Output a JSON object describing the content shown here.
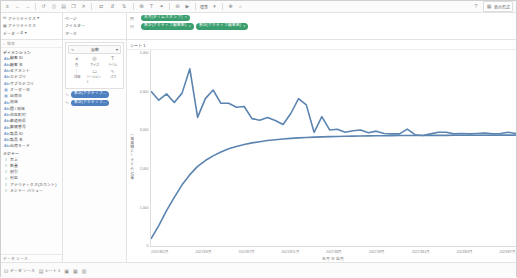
{
  "toolbar": {
    "icons": [
      {
        "name": "tableau-logo-icon",
        "glyph": "≡"
      },
      {
        "name": "back-icon",
        "glyph": "←"
      },
      {
        "name": "forward-icon",
        "glyph": "→"
      },
      {
        "name": "save-icon",
        "glyph": "⎙"
      },
      {
        "name": "undo-icon",
        "glyph": "↺"
      },
      {
        "name": "redo-icon",
        "glyph": "↻"
      },
      {
        "name": "new-worksheet-icon",
        "glyph": "▤"
      },
      {
        "name": "duplicate-icon",
        "glyph": "❐"
      },
      {
        "name": "clear-sheet-icon",
        "glyph": "✕"
      },
      {
        "name": "swap-rows-cols-icon",
        "glyph": "⇄"
      },
      {
        "name": "sort-ascending-icon",
        "glyph": "↓"
      },
      {
        "name": "sort-descending-icon",
        "glyph": "↑"
      },
      {
        "name": "group-icon",
        "glyph": "⊞"
      },
      {
        "name": "labels-icon",
        "glyph": "T"
      },
      {
        "name": "highlight-icon",
        "glyph": "✦"
      },
      {
        "name": "fixed-axis-icon",
        "glyph": "⊟"
      },
      {
        "name": "presentation-icon",
        "glyph": "▶"
      }
    ],
    "fit_label": "標準",
    "fit_caret": "▾",
    "show_me_label": "表示形式",
    "show_me_icon": "show-me-icon",
    "help_icon": "help-icon"
  },
  "datasource": {
    "connection_label": "データ",
    "name": "アナリティクス",
    "caret": "▾",
    "filter_label": "フィルター",
    "page_label": "ページ",
    "columns_label": "列",
    "rows_label": "行"
  },
  "shelves": {
    "columns_label": "列",
    "rows_label": "行",
    "columns_pills": [
      {
        "name": "columns-pill-date",
        "label": "年月(タイムスタンプ)",
        "caret": "▾",
        "agg": ""
      }
    ],
    "rows_pills": [
      {
        "name": "rows-pill-measure-1",
        "label": "集計(アクティブ顧客数)",
        "caret": "▾"
      },
      {
        "name": "rows-pill-measure-2",
        "label": "集計(アクティブ顧客数)",
        "caret": "▾"
      }
    ]
  },
  "data_pane": {
    "header_label": "データ",
    "search_placeholder": "検索",
    "search_icon": "search-icon",
    "sort_icon": "sort-icon",
    "table_name": "アナリティクス",
    "dimensions_header": "ディメンション",
    "fields": [
      {
        "name": "field-customer-id",
        "label": "顧客 ID",
        "icon": "abc"
      },
      {
        "name": "field-customer-name",
        "label": "顧客 名",
        "icon": "abc"
      },
      {
        "name": "field-segment",
        "label": "セグメント",
        "icon": "abc"
      },
      {
        "name": "field-category",
        "label": "カテゴリ",
        "icon": "abc"
      },
      {
        "name": "field-subcategory",
        "label": "サブカテゴリ",
        "icon": "abc"
      },
      {
        "name": "field-order-date",
        "label": "オーダー日",
        "icon": "cal"
      },
      {
        "name": "field-ship-date",
        "label": "出荷日",
        "icon": "cal"
      },
      {
        "name": "field-region",
        "label": "地域",
        "icon": "abc"
      },
      {
        "name": "field-country",
        "label": "国 / 地域",
        "icon": "abc"
      },
      {
        "name": "field-city",
        "label": "市区町村",
        "icon": "abc"
      },
      {
        "name": "field-state",
        "label": "都道府県",
        "icon": "abc"
      },
      {
        "name": "field-postal",
        "label": "郵便番号",
        "icon": "abc"
      },
      {
        "name": "field-product-id",
        "label": "製品 ID",
        "icon": "abc"
      },
      {
        "name": "field-product-name",
        "label": "製品 名",
        "icon": "abc"
      },
      {
        "name": "field-ship-mode",
        "label": "出荷モード",
        "icon": "abc"
      }
    ],
    "measures_header": "メジャー",
    "measures": [
      {
        "name": "measure-sales",
        "label": "売上",
        "icon": "num"
      },
      {
        "name": "measure-quantity",
        "label": "数量",
        "icon": "num"
      },
      {
        "name": "measure-discount",
        "label": "割引",
        "icon": "num"
      },
      {
        "name": "measure-profit",
        "label": "利益",
        "icon": "num"
      },
      {
        "name": "measure-record-count",
        "label": "アナリティクス(カウント)",
        "icon": "num"
      },
      {
        "name": "measure-names",
        "label": "メジャー バリュー",
        "icon": "num"
      }
    ],
    "footer_label": "データ ソース"
  },
  "marks": {
    "pages_label": "ページ",
    "filters_label": "フィルター",
    "marks_label": "マーク",
    "mark_type": "自動",
    "mark_type_caret": "▾",
    "mark_type_icon": "automatic-icon",
    "buttons": [
      {
        "name": "marks-color-button",
        "label": "色",
        "icon": "color-icon",
        "glyph": "◕"
      },
      {
        "name": "marks-size-button",
        "label": "サイズ",
        "icon": "size-icon",
        "glyph": "◎"
      },
      {
        "name": "marks-label-button",
        "label": "ラベル",
        "icon": "label-icon",
        "glyph": "T"
      },
      {
        "name": "marks-detail-button",
        "label": "詳細",
        "icon": "detail-icon",
        "glyph": "⁞"
      },
      {
        "name": "marks-tooltip-button",
        "label": "ツールヒント",
        "icon": "tooltip-icon",
        "glyph": "▭"
      },
      {
        "name": "marks-path-button",
        "label": "パス",
        "icon": "path-icon",
        "glyph": "∿"
      }
    ],
    "card_pills": [
      {
        "name": "marks-card-pill-1",
        "label": "集計(アクティブ…",
        "icon": "line-icon",
        "glyph": "∿"
      },
      {
        "name": "marks-card-pill-2",
        "label": "集計(アクティブ…",
        "icon": "line-icon",
        "glyph": "∿"
      }
    ]
  },
  "sheet": {
    "title": "シート 1"
  },
  "status_bar": {
    "tabs": [
      {
        "name": "status-tab-datasource",
        "label": "データ ソース",
        "icon": "datasource-icon",
        "glyph": "⛁"
      },
      {
        "name": "status-tab-sheet1",
        "label": "シート 1",
        "icon": "sheet-icon",
        "glyph": "▤"
      },
      {
        "name": "status-tab-new-sheet",
        "label": "",
        "icon": "new-sheet-icon",
        "glyph": "▣"
      },
      {
        "name": "status-tab-new-dashboard",
        "label": "",
        "icon": "new-dashboard-icon",
        "glyph": "▦"
      },
      {
        "name": "status-tab-new-story",
        "label": "",
        "icon": "new-story-icon",
        "glyph": "▥"
      }
    ]
  },
  "chart_data": {
    "type": "line",
    "title": "",
    "xlabel": "年月 日 自月",
    "ylabel": "集計(アクティブ顧客数)",
    "grid": false,
    "legend": null,
    "xlim": [
      0,
      47
    ],
    "ylim": [
      0,
      5000
    ],
    "xtick_labels": [
      "2020年11月",
      "2021年3月",
      "2021年7月",
      "2021年11月",
      "2022年3月",
      "2022年7月",
      "2022年11月",
      "2023年3月",
      "2023年7月"
    ],
    "ytick_labels": [
      "5,000",
      "4,000",
      "3,000",
      "2,000",
      "1,000",
      "0"
    ],
    "accent_color": "#5b84b1",
    "series": [
      {
        "name": "新規顧客数",
        "color": "#5b84b1",
        "values": [
          3950,
          3720,
          3880,
          3660,
          3900,
          4520,
          3280,
          3760,
          3980,
          3640,
          3640,
          3540,
          3560,
          3250,
          3210,
          3280,
          3200,
          3100,
          3380,
          3760,
          3600,
          2900,
          3300,
          2960,
          2980,
          2900,
          2940,
          2960,
          2890,
          2930,
          2870,
          2860,
          2860,
          2980,
          2840,
          2820,
          2860,
          2900,
          2900,
          2860,
          2870,
          2860,
          2870,
          2880,
          2860,
          2870,
          2900,
          2870
        ]
      },
      {
        "name": "累積顧客数",
        "color": "#5b84b1",
        "values": [
          180,
          520,
          900,
          1240,
          1560,
          1820,
          2030,
          2180,
          2300,
          2400,
          2480,
          2540,
          2590,
          2630,
          2660,
          2690,
          2710,
          2730,
          2745,
          2758,
          2768,
          2777,
          2784,
          2790,
          2795,
          2799,
          2803,
          2806,
          2809,
          2811,
          2813,
          2815,
          2817,
          2818,
          2819,
          2820,
          2821,
          2822,
          2823,
          2824,
          2825,
          2826,
          2826,
          2827,
          2827,
          2828,
          2828,
          2828
        ]
      }
    ]
  }
}
